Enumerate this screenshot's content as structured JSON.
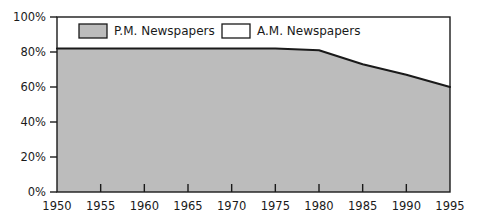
{
  "chart_data": {
    "type": "area",
    "title": "",
    "subtitle": "",
    "xlabel": "",
    "ylabel": "",
    "xlim": [
      1950,
      1995
    ],
    "ylim": [
      0,
      100
    ],
    "grid": false,
    "legend_position": "top-inside",
    "x": [
      1950,
      1955,
      1960,
      1965,
      1970,
      1975,
      1980,
      1985,
      1990,
      1995
    ],
    "series": [
      {
        "name": "P.M. Newspapers",
        "color": "#bcbcbc",
        "values": [
          82,
          82,
          82,
          82,
          82,
          82,
          81,
          73,
          67,
          60
        ]
      },
      {
        "name": "A.M. Newspapers",
        "color": "#ffffff",
        "values": [
          18,
          18,
          18,
          18,
          18,
          18,
          19,
          27,
          33,
          40
        ]
      }
    ],
    "xticks": [
      1950,
      1955,
      1960,
      1965,
      1970,
      1975,
      1980,
      1985,
      1990,
      1995
    ],
    "xtick_labels": [
      "1950",
      "1955",
      "1960",
      "1965",
      "1970",
      "1975",
      "1980",
      "1985",
      "1990",
      "1995"
    ],
    "yticks": [
      0,
      20,
      40,
      60,
      80,
      100
    ],
    "ytick_labels": [
      "0%",
      "20%",
      "40%",
      "60%",
      "80%",
      "100%"
    ]
  },
  "legend": {
    "items": [
      {
        "label": "P.M. Newspapers",
        "swatch": "gray"
      },
      {
        "label": "A.M. Newspapers",
        "swatch": "white"
      }
    ]
  },
  "axes": {
    "y_labels": [
      "100%",
      "80%",
      "60%",
      "40%",
      "20%",
      "0%"
    ],
    "x_labels": [
      "1950",
      "1955",
      "1960",
      "1965",
      "1970",
      "1975",
      "1980",
      "1985",
      "1990",
      "1995"
    ]
  },
  "colors": {
    "area_fill": "#bcbcbc",
    "line": "#1a1a1a",
    "axis": "#1a1a1a",
    "background": "#ffffff",
    "legend_swatch_gray": "#bcbcbc",
    "legend_swatch_white": "#ffffff"
  }
}
